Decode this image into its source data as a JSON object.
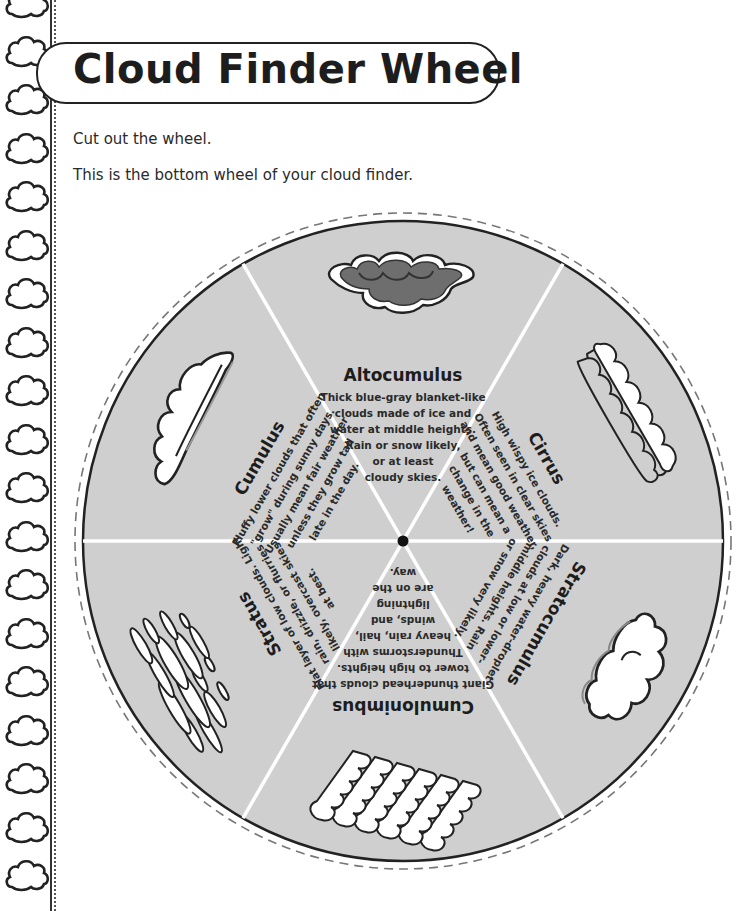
{
  "page": {
    "title": "Cloud Finder Wheel",
    "instructions": [
      "Cut out the wheel.",
      "This is the bottom wheel of your cloud finder."
    ]
  },
  "colors": {
    "wheel_fill": "#cfcfcf",
    "divider": "#ffffff",
    "outline": "#222222",
    "cloud_white": "#ffffff",
    "cloud_dark": "#6e6e6e"
  },
  "wheel": {
    "sectors": [
      {
        "name": "Altocumulus",
        "icon": "altocumulus-cloud-icon",
        "lines": [
          "Thick blue-gray blanket-like",
          "clouds made of ice and",
          "water at middle heights.",
          "Rain or snow likely,",
          "or at least",
          "cloudy skies."
        ]
      },
      {
        "name": "Cirrus",
        "icon": "cirrus-cloud-icon",
        "lines": [
          "High wispy ice clouds.",
          "Often seen in clear skies",
          "and mean good weather,",
          "but can mean a",
          "change in the",
          "weather!"
        ]
      },
      {
        "name": "Stratocumulus",
        "icon": "stratocumulus-cloud-icon",
        "lines": [
          "Dark, heavy water-droplet",
          "clouds at low or lower-",
          "middle heights. Rain",
          "or snow very likely."
        ]
      },
      {
        "name": "Cumulonimbus",
        "icon": "cumulonimbus-cloud-icon",
        "lines": [
          "Giant thunderhead clouds that",
          "tower to high heights.",
          "Thunderstorms with",
          "heavy rain, hail,",
          "winds, and",
          "lightning",
          "are on the",
          "way."
        ]
      },
      {
        "name": "Stratus",
        "icon": "stratus-cloud-icon",
        "lines": [
          "Flat layer of low clouds. Light",
          "rain, drizzle, or flurries",
          "likely, overcast skies",
          "at best."
        ]
      },
      {
        "name": "Cumulus",
        "icon": "cumulus-cloud-icon",
        "lines": [
          "Fluffy lower clouds that often",
          "\"grow\" during sunny days.",
          "Usually mean fair weather",
          "unless they grow tall",
          "late in the day."
        ]
      }
    ]
  }
}
